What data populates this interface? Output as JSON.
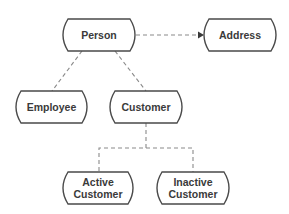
{
  "diagram": {
    "colors": {
      "background": "#ffffff",
      "node_stroke": "#4a4a4a",
      "node_fill": "#ffffff",
      "text": "#3a3a3a",
      "edge": "#8a8a8a"
    },
    "nodes": [
      {
        "id": "person",
        "lines": [
          "Person"
        ],
        "x": 63,
        "y": 19,
        "w": 72,
        "h": 32
      },
      {
        "id": "address",
        "lines": [
          "Address"
        ],
        "x": 204,
        "y": 19,
        "w": 72,
        "h": 32
      },
      {
        "id": "employee",
        "lines": [
          "Employee"
        ],
        "x": 16,
        "y": 91,
        "w": 71,
        "h": 32
      },
      {
        "id": "customer",
        "lines": [
          "Customer"
        ],
        "x": 110,
        "y": 91,
        "w": 72,
        "h": 32
      },
      {
        "id": "active-customer",
        "lines": [
          "Active",
          "Customer"
        ],
        "x": 63,
        "y": 172,
        "w": 70,
        "h": 32
      },
      {
        "id": "inactive-customer",
        "lines": [
          "Inactive",
          "Customer"
        ],
        "x": 157,
        "y": 172,
        "w": 72,
        "h": 32
      }
    ],
    "edges": [
      {
        "id": "person-address",
        "from": "person",
        "to": "address",
        "arrow": true,
        "points": [
          [
            136,
            35
          ],
          [
            198,
            35
          ]
        ]
      },
      {
        "id": "person-employee",
        "from": "person",
        "to": "employee",
        "arrow": false,
        "points": [
          [
            82,
            51
          ],
          [
            52,
            91
          ]
        ]
      },
      {
        "id": "person-customer",
        "from": "person",
        "to": "customer",
        "arrow": false,
        "points": [
          [
            115,
            51
          ],
          [
            146,
            91
          ]
        ]
      },
      {
        "id": "customer-active",
        "from": "customer",
        "to": "active-customer",
        "arrow": false,
        "points": [
          [
            146,
            123
          ],
          [
            146,
            148
          ],
          [
            99,
            148
          ],
          [
            99,
            172
          ]
        ]
      },
      {
        "id": "customer-inactive",
        "from": "customer",
        "to": "inactive-customer",
        "arrow": false,
        "points": [
          [
            146,
            148
          ],
          [
            193,
            148
          ],
          [
            193,
            172
          ]
        ]
      }
    ]
  }
}
